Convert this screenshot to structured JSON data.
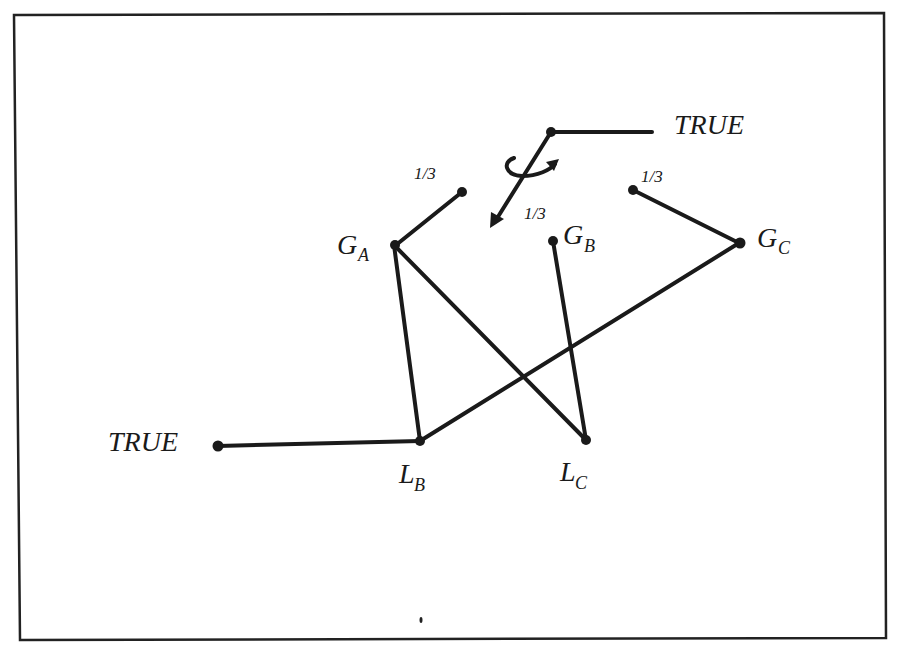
{
  "figure": {
    "border_color": "#222222",
    "ink_color": "#1a1a1a",
    "background": "#ffffff"
  },
  "nodes": {
    "G_A": {
      "main": "G",
      "sub": "A"
    },
    "G_B": {
      "main": "G",
      "sub": "B"
    },
    "G_C": {
      "main": "G",
      "sub": "C"
    },
    "L_B": {
      "main": "L",
      "sub": "B"
    },
    "L_C": {
      "main": "L",
      "sub": "C"
    }
  },
  "labels": {
    "true_top": "TRUE",
    "true_left": "TRUE",
    "frac_a": "1/3",
    "frac_mid": "1/3",
    "frac_c": "1/3"
  },
  "edges": [
    {
      "from": "G_A",
      "to": "stub_a",
      "label": "1/3"
    },
    {
      "from": "G_C",
      "to": "stub_c",
      "label": "1/3"
    },
    {
      "from": "spinner",
      "to": "TRUE_top"
    },
    {
      "from": "spinner",
      "to": "arrow_tip",
      "label": "1/3",
      "type": "rotating-arrow"
    },
    {
      "from": "G_A",
      "to": "L_B"
    },
    {
      "from": "G_A",
      "to": "L_C"
    },
    {
      "from": "G_B",
      "to": "L_C"
    },
    {
      "from": "G_C",
      "to": "L_B"
    },
    {
      "from": "TRUE_left",
      "to": "L_B"
    }
  ]
}
